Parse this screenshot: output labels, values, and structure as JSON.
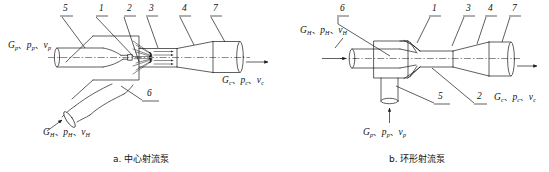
{
  "figure": {
    "title_a": "a. 中心射流泵",
    "title_b": "b. 环形射流泵"
  },
  "diagram_a": {
    "caption": "a. 中心射流泵",
    "part_numbers": [
      {
        "id": "a-num-5",
        "label": "5"
      },
      {
        "id": "a-num-1",
        "label": "1"
      },
      {
        "id": "a-num-2",
        "label": "2"
      },
      {
        "id": "a-num-3",
        "label": "3"
      },
      {
        "id": "a-num-4",
        "label": "4"
      },
      {
        "id": "a-num-7",
        "label": "7"
      },
      {
        "id": "a-num-6",
        "label": "6"
      }
    ],
    "flows": {
      "inlet_primary": {
        "g": "G",
        "g_sub": "p",
        "p": "p",
        "p_sub": "p",
        "v": "v",
        "v_sub": "p"
      },
      "inlet_suction": {
        "g": "G",
        "g_sub": "H",
        "p": "p",
        "p_sub": "H",
        "v": "v",
        "v_sub": "H"
      },
      "outlet": {
        "g": "G",
        "g_sub": "c",
        "p": "p",
        "p_sub": "c",
        "v": "v",
        "v_sub": "c"
      }
    }
  },
  "diagram_b": {
    "caption": "b. 环形射流泵",
    "part_numbers": [
      {
        "id": "b-num-6",
        "label": "6"
      },
      {
        "id": "b-num-1",
        "label": "1"
      },
      {
        "id": "b-num-3",
        "label": "3"
      },
      {
        "id": "b-num-4",
        "label": "4"
      },
      {
        "id": "b-num-7",
        "label": "7"
      },
      {
        "id": "b-num-5",
        "label": "5"
      },
      {
        "id": "b-num-2",
        "label": "2"
      }
    ],
    "flows": {
      "inlet_suction": {
        "g": "G",
        "g_sub": "H",
        "p": "p",
        "p_sub": "H",
        "v": "v",
        "v_sub": "H"
      },
      "inlet_primary": {
        "g": "G",
        "g_sub": "p",
        "p": "p",
        "p_sub": "p",
        "v": "v",
        "v_sub": "p"
      },
      "outlet": {
        "g": "G",
        "g_sub": "c",
        "p": "p",
        "p_sub": "c",
        "v": "v",
        "v_sub": "c"
      }
    }
  },
  "style": {
    "line_color": "#1a1a1a",
    "text_color": "#111111",
    "background": "#ffffff"
  }
}
